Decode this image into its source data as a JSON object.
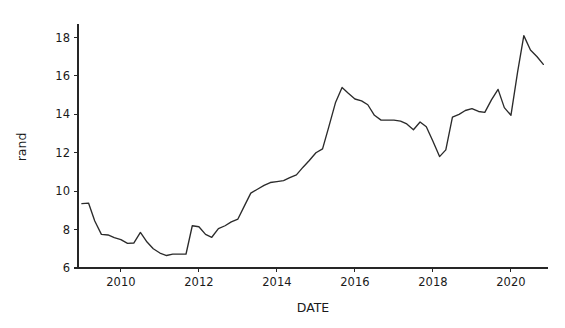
{
  "chart_data": {
    "type": "line",
    "title": "",
    "subtitle": "",
    "xlabel": "DATE",
    "ylabel": "rand",
    "xlim": [
      2008.9,
      2020.95
    ],
    "ylim": [
      6,
      18.6
    ],
    "xticks": [
      2010,
      2012,
      2014,
      2016,
      2018,
      2020
    ],
    "xtick_labels": [
      "2010",
      "2012",
      "2014",
      "2016",
      "2018",
      "2020"
    ],
    "yticks": [
      6,
      8,
      10,
      12,
      14,
      16,
      18
    ],
    "ytick_labels": [
      "6",
      "8",
      "10",
      "12",
      "14",
      "16",
      "18"
    ],
    "grid": false,
    "legend": false,
    "legend_position": "none",
    "line_color": "#2b2b2b",
    "background_color": "#ffffff",
    "series": [
      {
        "name": "rand",
        "x": [
          2009.0,
          2009.17,
          2009.33,
          2009.5,
          2009.67,
          2009.83,
          2010.0,
          2010.17,
          2010.33,
          2010.5,
          2010.67,
          2010.83,
          2011.0,
          2011.17,
          2011.33,
          2011.5,
          2011.67,
          2011.83,
          2012.0,
          2012.17,
          2012.33,
          2012.5,
          2012.67,
          2012.83,
          2013.0,
          2013.17,
          2013.33,
          2013.5,
          2013.67,
          2013.83,
          2014.0,
          2014.17,
          2014.33,
          2014.5,
          2014.67,
          2014.83,
          2015.0,
          2015.17,
          2015.33,
          2015.5,
          2015.67,
          2015.83,
          2016.0,
          2016.17,
          2016.33,
          2016.5,
          2016.67,
          2016.83,
          2017.0,
          2017.17,
          2017.33,
          2017.5,
          2017.67,
          2017.83,
          2018.0,
          2018.17,
          2018.33,
          2018.5,
          2018.67,
          2018.83,
          2019.0,
          2019.17,
          2019.33,
          2019.5,
          2019.67,
          2019.83,
          2020.0,
          2020.17,
          2020.33,
          2020.5,
          2020.67,
          2020.83
        ],
        "values": [
          9.35,
          9.38,
          8.45,
          7.75,
          7.72,
          7.58,
          7.48,
          7.28,
          7.3,
          7.85,
          7.35,
          7.0,
          6.78,
          6.65,
          6.72,
          6.72,
          6.73,
          8.2,
          8.15,
          7.75,
          7.6,
          8.05,
          8.2,
          8.4,
          8.55,
          9.25,
          9.9,
          10.1,
          10.3,
          10.45,
          10.5,
          10.55,
          10.7,
          10.85,
          11.25,
          11.6,
          12.0,
          12.2,
          13.35,
          14.6,
          15.4,
          15.1,
          14.8,
          14.7,
          14.5,
          13.95,
          13.7,
          13.7,
          13.7,
          13.65,
          13.5,
          13.2,
          13.6,
          13.35,
          12.6,
          11.8,
          12.15,
          13.85,
          14.0,
          14.2,
          14.3,
          14.15,
          14.1,
          14.75,
          15.3,
          14.35,
          13.95,
          16.2,
          18.1,
          17.35,
          17.0,
          16.6
        ]
      }
    ],
    "annotations": [
      {
        "label": "series start",
        "x": 2009.0,
        "y": 9.35
      },
      {
        "label": "series minimum",
        "x": 2011.17,
        "y": 6.65
      },
      {
        "label": "2016 local peak",
        "x": 2015.83,
        "y": 15.4
      },
      {
        "label": "2018 dip",
        "x": 2018.17,
        "y": 11.8
      },
      {
        "label": "2020 maximum",
        "x": 2020.33,
        "y": 18.1
      },
      {
        "label": "series end",
        "x": 2020.83,
        "y": 16.6
      }
    ]
  }
}
